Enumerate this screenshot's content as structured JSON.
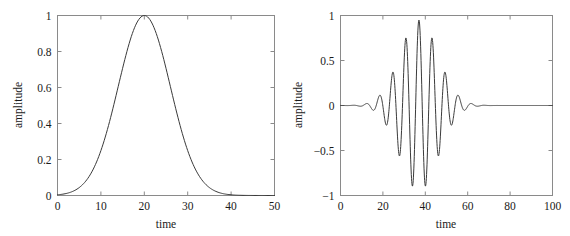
{
  "figure": {
    "background": "#ffffff",
    "line_color": "#3a3a3a",
    "frame_color": "#8a8a8a"
  },
  "chart_data": [
    {
      "type": "line",
      "id": "gaussian-envelope",
      "title": "",
      "xlabel": "time",
      "ylabel": "amplitude",
      "xlim": [
        0,
        50
      ],
      "ylim": [
        0,
        1
      ],
      "xticks": [
        0,
        10,
        20,
        30,
        40,
        50
      ],
      "xticklabels": [
        "0",
        "10",
        "20",
        "30",
        "40",
        "50"
      ],
      "yticks": [
        0,
        0.2,
        0.4,
        0.6,
        0.8,
        1
      ],
      "yticklabels": [
        "0",
        "0.2",
        "0.4",
        "0.6",
        "0.8",
        "1"
      ],
      "grid": false,
      "legend": false,
      "series": [
        {
          "name": "gaussian",
          "peak_x": 20,
          "peak_y": 1,
          "sigma": 6,
          "x": [
            0,
            1,
            2,
            3,
            4,
            5,
            6,
            7,
            8,
            9,
            10,
            11,
            12,
            13,
            14,
            15,
            16,
            17,
            18,
            19,
            20,
            21,
            22,
            23,
            24,
            25,
            26,
            27,
            28,
            29,
            30,
            31,
            32,
            33,
            34,
            35,
            36,
            37,
            38,
            39,
            40,
            41,
            42,
            43,
            44,
            45,
            46,
            47,
            48,
            49,
            50
          ],
          "values": [
            0.004,
            0.007,
            0.011,
            0.017,
            0.025,
            0.037,
            0.053,
            0.073,
            0.099,
            0.132,
            0.171,
            0.217,
            0.271,
            0.33,
            0.394,
            0.458,
            0.522,
            0.585,
            0.646,
            0.705,
            0.757,
            0.804,
            0.846,
            0.882,
            0.913,
            0.939,
            0.959,
            0.973,
            0.983,
            0.989,
            1.0,
            0.989,
            0.959,
            0.913,
            0.846,
            0.757,
            0.646,
            0.522,
            0.394,
            0.271,
            0.171,
            0.099,
            0.053,
            0.025,
            0.011,
            0.004,
            0.002,
            0.001,
            0.0,
            0.0,
            0.0
          ]
        }
      ]
    },
    {
      "type": "line",
      "id": "gabor-wavelet",
      "title": "",
      "xlabel": "time",
      "ylabel": "amplitude",
      "xlim": [
        0,
        100
      ],
      "ylim": [
        -1,
        1
      ],
      "xticks": [
        0,
        20,
        40,
        60,
        80,
        100
      ],
      "xticklabels": [
        "0",
        "20",
        "40",
        "60",
        "80",
        "100"
      ],
      "yticks": [
        -1,
        -0.5,
        0,
        0.5,
        1
      ],
      "yticklabels": [
        "−1",
        "−0.5",
        "0",
        "0.5",
        "1"
      ],
      "grid": false,
      "legend": false,
      "series": [
        {
          "name": "modulated-gaussian",
          "center": 37,
          "sigma": 9,
          "period": 6.2,
          "max_value": 0.95,
          "min_value": -0.92
        }
      ]
    }
  ],
  "panels": [
    {
      "name": "left-panel",
      "xlabel": "time",
      "ylabel": "amplitude"
    },
    {
      "name": "right-panel",
      "xlabel": "time",
      "ylabel": "amplitude"
    }
  ]
}
